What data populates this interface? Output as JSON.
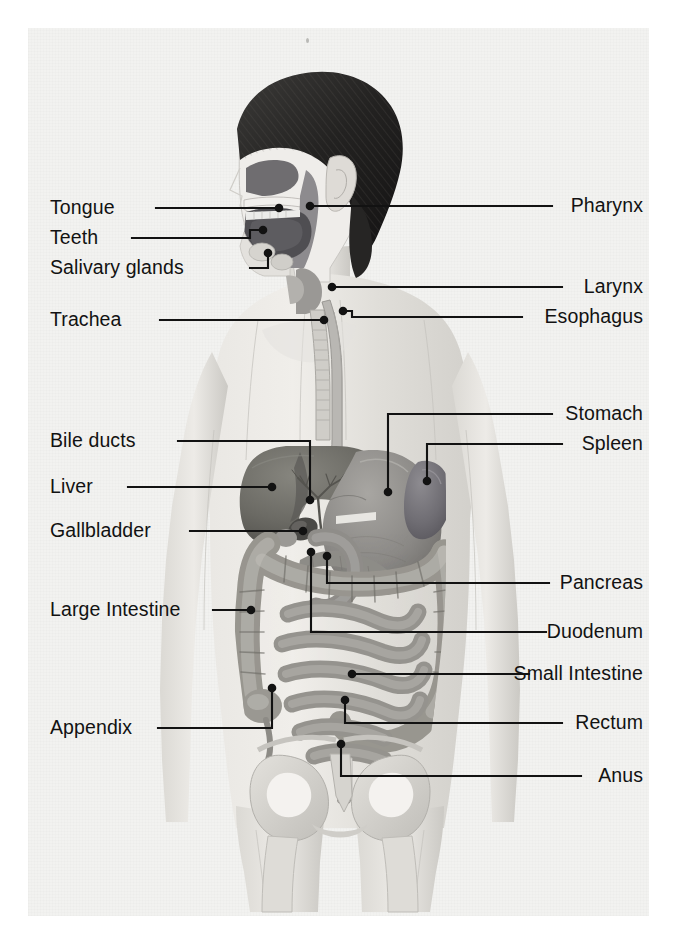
{
  "diagram": {
    "background_color": "#f2f2f0",
    "ink_color": "#121212",
    "page_color": "#ffffff"
  },
  "labels_left": [
    {
      "id": "tongue",
      "text": "Tongue",
      "x": 50,
      "y": 198,
      "leader_end_x": 156,
      "leader_y": 208,
      "target_x": 279,
      "target_y": 208
    },
    {
      "id": "teeth",
      "text": "Teeth",
      "x": 50,
      "y": 228,
      "leader_end_x": 132,
      "leader_y": 238,
      "target_x": 263,
      "target_y": 237,
      "elbow_x": 250,
      "elbow_y": 238,
      "target2_y": 230
    },
    {
      "id": "salivary-glands",
      "text": "Salivary glands",
      "x": 50,
      "y": 258,
      "leader_end_x": 250,
      "leader_y": 268,
      "target_x": 268,
      "target_y": 268,
      "elbow_x": 268,
      "elbow_y": 268,
      "target2_y": 253
    },
    {
      "id": "trachea",
      "text": "Trachea",
      "x": 50,
      "y": 310,
      "leader_end_x": 160,
      "leader_y": 320,
      "target_x": 324,
      "target_y": 320
    },
    {
      "id": "bile-ducts",
      "text": "Bile ducts",
      "x": 50,
      "y": 431,
      "leader_end_x": 178,
      "leader_y": 441,
      "target_x": 310,
      "target_y": 441
    },
    {
      "id": "liver",
      "text": "Liver",
      "x": 50,
      "y": 477,
      "leader_end_x": 128,
      "leader_y": 487,
      "target_x": 272,
      "target_y": 487
    },
    {
      "id": "gallbladder",
      "text": "Gallbladder",
      "x": 50,
      "y": 521,
      "leader_end_x": 190,
      "leader_y": 531,
      "target_x": 305,
      "target_y": 531
    },
    {
      "id": "large-intestine",
      "text": "Large Intestine",
      "x": 50,
      "y": 600,
      "leader_end_x": 213,
      "leader_y": 610,
      "target_x": 251,
      "target_y": 610
    },
    {
      "id": "appendix",
      "text": "Appendix",
      "x": 50,
      "y": 718,
      "leader_end_x": 158,
      "leader_y": 728,
      "target_x": 272,
      "target_y": 728
    }
  ],
  "labels_right": [
    {
      "id": "pharynx",
      "text": "Pharynx",
      "right": 643,
      "y": 196,
      "leader_start_x": 552,
      "leader_y": 206,
      "target_x": 310,
      "target_y": 206
    },
    {
      "id": "larynx",
      "text": "Larynx",
      "right": 643,
      "y": 277,
      "leader_start_x": 562,
      "leader_y": 287,
      "target_x": 332,
      "target_y": 287
    },
    {
      "id": "esophagus",
      "text": "Esophagus",
      "right": 643,
      "y": 307,
      "leader_start_x": 522,
      "leader_y": 317,
      "target_x": 343,
      "target_y": 311
    },
    {
      "id": "stomach",
      "text": "Stomach",
      "right": 643,
      "y": 404,
      "leader_start_x": 552,
      "leader_y": 414,
      "target_x": 400,
      "target_y": 492
    },
    {
      "id": "spleen",
      "text": "Spleen",
      "right": 643,
      "y": 434,
      "leader_start_x": 562,
      "leader_y": 444,
      "target_x": 427,
      "target_y": 481
    },
    {
      "id": "pancreas",
      "text": "Pancreas",
      "right": 643,
      "y": 573,
      "leader_start_x": 549,
      "leader_y": 583,
      "target_x": 327,
      "target_y": 583
    },
    {
      "id": "duodenum",
      "text": "Duodenum",
      "right": 643,
      "y": 622,
      "leader_start_x": 546,
      "leader_y": 632,
      "target_x": 311,
      "target_y": 632
    },
    {
      "id": "small-intestine",
      "text": "Small Intestine",
      "right": 643,
      "y": 664,
      "leader_start_x": 529,
      "leader_y": 674,
      "target_x": 352,
      "target_y": 674
    },
    {
      "id": "rectum",
      "text": "Rectum",
      "right": 643,
      "y": 713,
      "leader_start_x": 562,
      "leader_y": 723,
      "target_x": 345,
      "target_y": 723
    },
    {
      "id": "anus",
      "text": "Anus",
      "right": 643,
      "y": 766,
      "leader_start_x": 581,
      "leader_y": 776,
      "target_x": 341,
      "target_y": 776
    }
  ],
  "organs": [
    {
      "id": "liver",
      "name": "Liver",
      "fill": "#6e6d6c"
    },
    {
      "id": "stomach",
      "name": "Stomach",
      "fill": "#8d8c8a"
    },
    {
      "id": "spleen",
      "name": "Spleen",
      "fill": "#77767a"
    },
    {
      "id": "large-intestine",
      "name": "Large Intestine",
      "fill": "#a6a4a0"
    },
    {
      "id": "small-intestine",
      "name": "Small Intestine",
      "fill": "#9e9c98"
    },
    {
      "id": "gallbladder",
      "name": "Gallbladder",
      "fill": "#585756"
    },
    {
      "id": "pancreas",
      "name": "Pancreas",
      "fill": "#8a8886"
    },
    {
      "id": "esophagus",
      "name": "Esophagus",
      "fill": "#9b9996"
    },
    {
      "id": "trachea",
      "name": "Trachea",
      "fill": "#c3c1bd"
    },
    {
      "id": "pelvis",
      "name": "Pelvic bones",
      "fill": "#d2d0cb"
    },
    {
      "id": "hair",
      "name": "Hair",
      "fill": "#2b2a29"
    },
    {
      "id": "oral-cavity",
      "name": "Oral cavity",
      "fill": "#57565a"
    },
    {
      "id": "body",
      "name": "Body silhouette",
      "fill": "#dedcd8"
    }
  ]
}
